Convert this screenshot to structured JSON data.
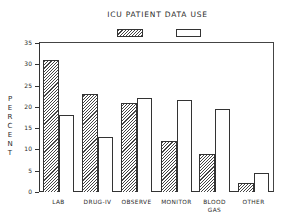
{
  "chart_data": {
    "type": "bar",
    "title": "ICU PATIENT DATA USE",
    "xlabel": "",
    "ylabel": "PERCENT",
    "ylim": [
      0,
      35
    ],
    "yticks": [
      0,
      5,
      10,
      15,
      20,
      25,
      30,
      35
    ],
    "grid": false,
    "legend": {
      "position": "top-center",
      "entries": [
        "",
        ""
      ]
    },
    "categories": [
      "LAB",
      "DRUG-IV",
      "OBSERVE",
      "MONITOR",
      "BLOOD GAS",
      "OTHER"
    ],
    "series": [
      {
        "name": "hatched",
        "style": "hatched",
        "values": [
          31,
          23,
          21,
          12,
          9,
          2
        ]
      },
      {
        "name": "open",
        "style": "white",
        "values": [
          18,
          13,
          22,
          21.5,
          19.5,
          4.5
        ]
      }
    ]
  },
  "labels": {
    "title": "ICU PATIENT DATA USE",
    "ylabel": [
      "P",
      "E",
      "R",
      "C",
      "E",
      "N",
      "T"
    ],
    "yticks": [
      "0",
      "5",
      "10",
      "15",
      "20",
      "25",
      "30",
      "35"
    ],
    "categories": [
      "LAB",
      "DRUG-IV",
      "OBSERVE",
      "MONITOR",
      "BLOOD\nGAS",
      "OTHER"
    ]
  }
}
